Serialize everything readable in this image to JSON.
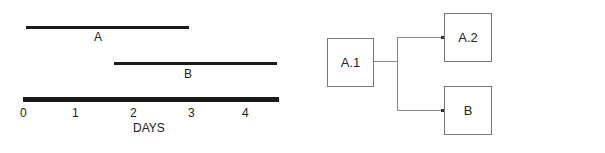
{
  "timeline": {
    "axis_label": "DAYS",
    "ticks": [
      "0",
      "1",
      "2",
      "3",
      "4"
    ],
    "tasks": [
      {
        "name": "A",
        "start": 0,
        "end": 3
      },
      {
        "name": "B",
        "start": 1.7,
        "end": 4.6
      }
    ]
  },
  "network": {
    "nodes": [
      "A.1",
      "A.2",
      "B"
    ],
    "edges": [
      {
        "from": "A.1",
        "to": "A.2"
      },
      {
        "from": "A.1",
        "to": "B"
      }
    ]
  }
}
